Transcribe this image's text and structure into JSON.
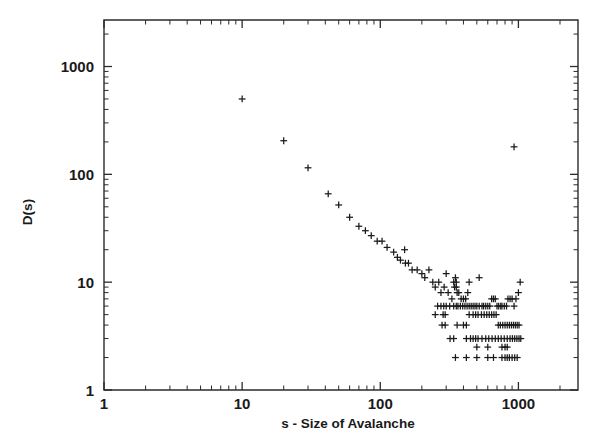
{
  "figure": {
    "background": "#ffffff",
    "ink_color": "#1a1a1a",
    "marker_symbol": "plus"
  },
  "chart_data": {
    "type": "scatter",
    "title": "",
    "subtitle": "",
    "xlabel": "s - Size of Avalanche",
    "ylabel": "D(s)",
    "xscale": "log",
    "yscale": "log",
    "xlim": [
      1,
      2700
    ],
    "ylim": [
      1,
      2700
    ],
    "grid": false,
    "legend": null,
    "xticks": [
      1,
      10,
      100,
      1000
    ],
    "xticklabels": [
      "1",
      "10",
      "100",
      "1000"
    ],
    "yticks": [
      1,
      10,
      100,
      1000
    ],
    "yticklabels": [
      "1",
      "10",
      "100",
      "1000"
    ],
    "marker": "+",
    "series": [
      {
        "name": "D(s)",
        "color": "#1a1a1a",
        "points": [
          [
            10,
            500
          ],
          [
            20,
            205
          ],
          [
            30,
            115
          ],
          [
            42,
            66
          ],
          [
            50,
            52
          ],
          [
            60,
            40
          ],
          [
            70,
            33
          ],
          [
            78,
            30
          ],
          [
            86,
            27
          ],
          [
            95,
            24
          ],
          [
            103,
            24
          ],
          [
            112,
            21
          ],
          [
            125,
            19
          ],
          [
            133,
            17
          ],
          [
            140,
            16
          ],
          [
            152,
            15
          ],
          [
            160,
            15
          ],
          [
            170,
            13
          ],
          [
            185,
            13
          ],
          [
            150,
            20
          ],
          [
            200,
            12
          ],
          [
            210,
            11
          ],
          [
            225,
            13
          ],
          [
            240,
            10
          ],
          [
            250,
            9
          ],
          [
            265,
            10
          ],
          [
            275,
            8
          ],
          [
            290,
            9
          ],
          [
            300,
            12
          ],
          [
            310,
            8
          ],
          [
            330,
            7
          ],
          [
            345,
            9
          ],
          [
            355,
            9
          ],
          [
            360,
            8
          ],
          [
            370,
            8
          ],
          [
            385,
            7
          ],
          [
            400,
            7
          ],
          [
            415,
            7
          ],
          [
            430,
            8
          ],
          [
            260,
            6
          ],
          [
            275,
            6
          ],
          [
            288,
            6
          ],
          [
            300,
            6
          ],
          [
            318,
            6
          ],
          [
            250,
            5
          ],
          [
            285,
            5
          ],
          [
            295,
            5
          ],
          [
            340,
            6
          ],
          [
            355,
            6
          ],
          [
            365,
            6
          ],
          [
            380,
            6
          ],
          [
            395,
            6
          ],
          [
            410,
            6
          ],
          [
            425,
            6
          ],
          [
            440,
            6
          ],
          [
            455,
            6
          ],
          [
            470,
            6
          ],
          [
            485,
            6
          ],
          [
            500,
            6
          ],
          [
            520,
            6
          ],
          [
            545,
            6
          ],
          [
            560,
            6
          ],
          [
            580,
            6
          ],
          [
            600,
            6
          ],
          [
            620,
            6
          ],
          [
            640,
            7
          ],
          [
            660,
            7
          ],
          [
            680,
            7
          ],
          [
            700,
            6
          ],
          [
            720,
            6
          ],
          [
            745,
            6
          ],
          [
            760,
            6
          ],
          [
            790,
            6
          ],
          [
            820,
            6
          ],
          [
            840,
            7
          ],
          [
            870,
            7
          ],
          [
            900,
            7
          ],
          [
            930,
            6
          ],
          [
            960,
            7
          ],
          [
            1000,
            8
          ],
          [
            1030,
            10
          ],
          [
            280,
            4
          ],
          [
            295,
            4
          ],
          [
            360,
            4
          ],
          [
            400,
            4
          ],
          [
            420,
            4
          ],
          [
            440,
            5
          ],
          [
            470,
            5
          ],
          [
            490,
            5
          ],
          [
            510,
            5
          ],
          [
            540,
            5
          ],
          [
            565,
            5
          ],
          [
            590,
            5
          ],
          [
            615,
            5
          ],
          [
            640,
            5
          ],
          [
            665,
            5
          ],
          [
            690,
            5
          ],
          [
            715,
            4
          ],
          [
            740,
            4
          ],
          [
            770,
            4
          ],
          [
            800,
            4
          ],
          [
            830,
            4
          ],
          [
            860,
            4
          ],
          [
            890,
            4
          ],
          [
            920,
            4
          ],
          [
            950,
            4
          ],
          [
            980,
            4
          ],
          [
            1010,
            4
          ],
          [
            320,
            3
          ],
          [
            340,
            3
          ],
          [
            420,
            3
          ],
          [
            450,
            3
          ],
          [
            470,
            3
          ],
          [
            490,
            3
          ],
          [
            510,
            3
          ],
          [
            545,
            3
          ],
          [
            580,
            3
          ],
          [
            610,
            3
          ],
          [
            645,
            3
          ],
          [
            680,
            3
          ],
          [
            715,
            3
          ],
          [
            750,
            3
          ],
          [
            790,
            3
          ],
          [
            830,
            3
          ],
          [
            870,
            3
          ],
          [
            905,
            3
          ],
          [
            940,
            3
          ],
          [
            975,
            3
          ],
          [
            1010,
            3
          ],
          [
            1040,
            3
          ],
          [
            500,
            2.5
          ],
          [
            600,
            2.5
          ],
          [
            760,
            2.5
          ],
          [
            800,
            2.5
          ],
          [
            830,
            2.5
          ],
          [
            350,
            2
          ],
          [
            420,
            2
          ],
          [
            500,
            2
          ],
          [
            600,
            2
          ],
          [
            660,
            2
          ],
          [
            760,
            2
          ],
          [
            800,
            2
          ],
          [
            830,
            2
          ],
          [
            860,
            2
          ],
          [
            900,
            2
          ],
          [
            940,
            2
          ],
          [
            980,
            2
          ],
          [
            930,
            180
          ],
          [
            440,
            10
          ],
          [
            520,
            11
          ],
          [
            350,
            11
          ],
          [
            340,
            10
          ],
          [
            355,
            10
          ]
        ]
      }
    ],
    "annotations": [
      {
        "text": "power-law decay with flattening at large s",
        "visible": false
      }
    ]
  }
}
